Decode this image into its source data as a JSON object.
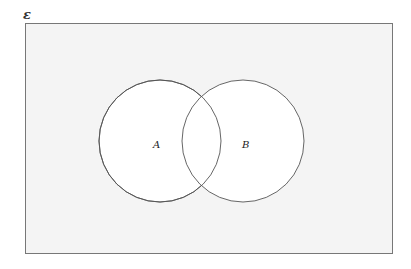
{
  "diagram": {
    "type": "venn",
    "universe_label": "ε",
    "sets": [
      {
        "name": "A",
        "label": "A",
        "cx": 160,
        "cy": 141,
        "r": 61
      },
      {
        "name": "B",
        "label": "B",
        "cx": 243,
        "cy": 141,
        "r": 61
      }
    ],
    "colors": {
      "universe_fill": "#f4f4f4",
      "universe_stroke": "#777777",
      "circle_fill": "#ffffff",
      "circle_stroke": "#555555"
    }
  }
}
